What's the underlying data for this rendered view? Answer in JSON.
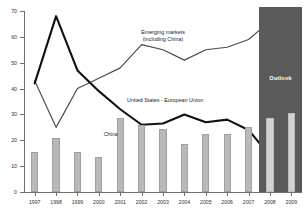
{
  "chart_data": {
    "type": "line",
    "title": "",
    "xlabel": "",
    "ylabel": "",
    "ylim": [
      0,
      70
    ],
    "ytick_values": [
      0,
      10,
      20,
      30,
      40,
      50,
      60,
      70
    ],
    "grid": false,
    "legend_position": "inline-annotations",
    "categories": [
      "1997",
      "1998",
      "1999",
      "2000",
      "2001",
      "2002",
      "2003",
      "2004",
      "2005",
      "2006",
      "2007",
      "2008",
      "2009"
    ],
    "series": [
      {
        "name": "United States - European Union",
        "type": "line",
        "style": "thick-black",
        "values": [
          42,
          68,
          47,
          39,
          32,
          26,
          26.5,
          30,
          27,
          28,
          24,
          14,
          13
        ]
      },
      {
        "name": "Emerging markets (including China)",
        "type": "line",
        "style": "thin-gray",
        "values": [
          43,
          25,
          40,
          44,
          48,
          57,
          55,
          51,
          55,
          56,
          59,
          66,
          68
        ]
      },
      {
        "name": "China",
        "type": "bar",
        "style": "gray-bars",
        "values": [
          15.5,
          21,
          15.5,
          13.5,
          28.5,
          26,
          24.5,
          18.5,
          22.5,
          22.5,
          25,
          28.5,
          30.5
        ]
      }
    ],
    "annotations": [
      {
        "name": "emerging-markets-label",
        "line1": "Emerging markets",
        "line2": "(including China)"
      },
      {
        "name": "united-states-european-union-label",
        "text": "United States - European Union"
      },
      {
        "name": "china-label",
        "text": "China"
      },
      {
        "name": "outlook-label",
        "text": "Outlook"
      }
    ],
    "shaded_region": {
      "label": "Outlook",
      "from": "2008",
      "to": "2009",
      "color": "#5a5a5a"
    },
    "colors": {
      "bar": "#b9b9b9",
      "bar_outlook": "#d2d2d2",
      "line_us_eu": "#111111",
      "line_emerging": "#4a4a4a",
      "outlook_band": "#5a5a5a",
      "axis": "#6f6f6f"
    }
  }
}
